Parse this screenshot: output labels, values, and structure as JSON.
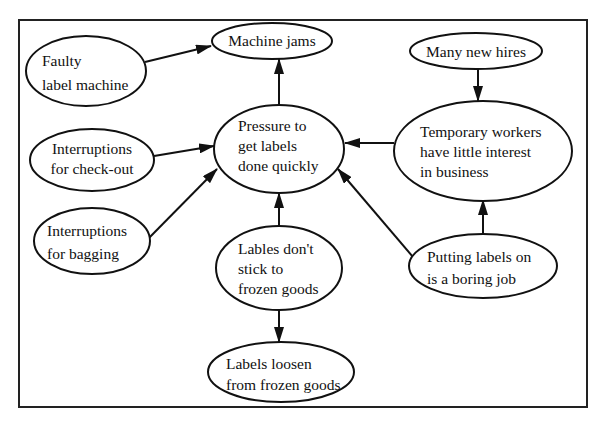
{
  "diagram": {
    "type": "cause-effect-diagram",
    "nodes": [
      {
        "id": "faulty",
        "lines": [
          "Faulty",
          "label machine"
        ]
      },
      {
        "id": "jams",
        "lines": [
          "Machine jams"
        ]
      },
      {
        "id": "checkout",
        "lines": [
          "Interruptions",
          "for check-out"
        ]
      },
      {
        "id": "pressure",
        "lines": [
          "Pressure to",
          "get labels",
          "done quickly"
        ]
      },
      {
        "id": "hires",
        "lines": [
          "Many new hires"
        ]
      },
      {
        "id": "temp",
        "lines": [
          "Temporary workers",
          "have little interest",
          "in business"
        ]
      },
      {
        "id": "bagging",
        "lines": [
          "Interruptions",
          "for bagging"
        ]
      },
      {
        "id": "stick",
        "lines": [
          "Lables don't",
          "stick to",
          "frozen goods"
        ]
      },
      {
        "id": "boring",
        "lines": [
          "Putting labels on",
          "is a boring job"
        ]
      },
      {
        "id": "loosen",
        "lines": [
          "Labels loosen",
          "from frozen goods"
        ]
      }
    ],
    "edges": [
      {
        "from": "faulty",
        "to": "jams"
      },
      {
        "from": "pressure",
        "to": "jams"
      },
      {
        "from": "checkout",
        "to": "pressure"
      },
      {
        "from": "bagging",
        "to": "pressure"
      },
      {
        "from": "stick",
        "to": "pressure"
      },
      {
        "from": "temp",
        "to": "pressure"
      },
      {
        "from": "boring",
        "to": "pressure"
      },
      {
        "from": "hires",
        "to": "temp"
      },
      {
        "from": "boring",
        "to": "temp"
      },
      {
        "from": "stick",
        "to": "loosen"
      }
    ]
  }
}
